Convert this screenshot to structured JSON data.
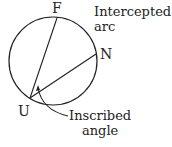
{
  "diagram": {
    "points": {
      "F": "F",
      "N": "N",
      "U": "U"
    },
    "labels": {
      "intercepted_arc_line1": "Intercepted",
      "intercepted_arc_line2": "arc",
      "inscribed_angle_line1": "Inscribed",
      "inscribed_angle_line2": "angle"
    },
    "colors": {
      "stroke": "#222222",
      "background": "#ffffff"
    }
  }
}
